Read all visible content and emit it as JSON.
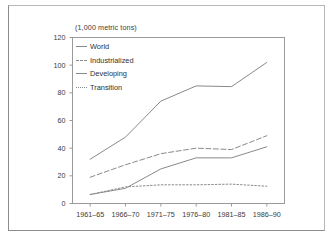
{
  "chart_data": {
    "type": "line",
    "title": "",
    "subtitle": "",
    "unit_label": "(1,000 metric tons)",
    "xlabel": "",
    "ylabel": "",
    "ylim": [
      0,
      120
    ],
    "ytick_labels": [
      "0",
      "20",
      "40",
      "60",
      "80",
      "100",
      "120"
    ],
    "ytick_values": [
      0,
      20,
      40,
      60,
      80,
      100,
      120
    ],
    "categories": [
      "1961–65",
      "1966–70",
      "1971–75",
      "1976–80",
      "1981–85",
      "1986–90"
    ],
    "grid": false,
    "legend_position": "top-left",
    "series": [
      {
        "name": "World",
        "style": "solid",
        "color": "#8a8a8a",
        "values": [
          32,
          48,
          74,
          85,
          84.5,
          102
        ]
      },
      {
        "name": "Industrialized",
        "style": "dashed",
        "color": "#8a8a8a",
        "values": [
          19,
          28,
          36,
          40,
          39,
          49
        ]
      },
      {
        "name": "Developing",
        "style": "solid",
        "color": "#8a8a8a",
        "values": [
          6.5,
          11,
          25,
          33,
          33,
          41
        ]
      },
      {
        "name": "Transition",
        "style": "dotted",
        "color": "#8a8a8a",
        "values": [
          6.5,
          12,
          13.5,
          13.5,
          14,
          12.5
        ]
      }
    ]
  },
  "colors": {
    "line": "#8a8a8a",
    "axis": "#9a9a9a",
    "text": "#333333",
    "frame": "#8c8c8c",
    "background": "#ffffff"
  }
}
